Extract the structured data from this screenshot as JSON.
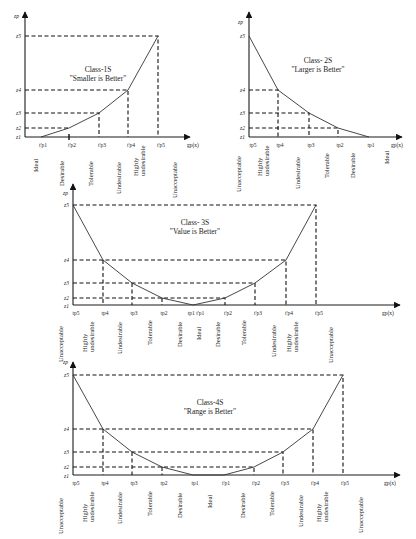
{
  "charts": [
    {
      "id": "class-1s",
      "title_line1": "Class-1S",
      "title_line2": "\"Smaller is Better\"",
      "y_axis_label": "zp",
      "x_axis_label": "gp(x)",
      "z_levels": [
        "z5",
        "z4",
        "z3",
        "z2",
        "z1"
      ],
      "tick_labels": [
        "t'p1",
        "t'p2",
        "t'p3",
        "t'p4",
        "t'p5"
      ],
      "categories": [
        "Ideal",
        "Desirable",
        "Tolerable",
        "Undesirable",
        "Highly undesirable",
        "Unacceptable"
      ]
    },
    {
      "id": "class-2s",
      "title_line1": "Class- 2S",
      "title_line2": "\"Larger is Better\"",
      "y_axis_label": "zp",
      "x_axis_label": "gp(x)",
      "z_levels": [
        "z5",
        "z4",
        "z3",
        "z2",
        "z1"
      ],
      "tick_labels": [
        "tp5",
        "tp4",
        "tp3",
        "tp2",
        "tp1"
      ],
      "categories": [
        "Unacceptable",
        "Highly undesirable",
        "Undesirable",
        "Tolerable",
        "Desirable",
        "Ideal"
      ]
    },
    {
      "id": "class-3s",
      "title_line1": "Class- 3S",
      "title_line2": "\"Value is Better\"",
      "y_axis_label": "zp",
      "x_axis_label": "gp(x)",
      "z_levels": [
        "z5",
        "z4",
        "z3",
        "z2",
        "z1"
      ],
      "tick_labels": [
        "tp5",
        "tp4",
        "tp3",
        "tp2",
        "tp1 t'p1",
        "t'p2",
        "t'p3",
        "t'p4",
        "t'p5"
      ],
      "categories": [
        "Unacceptable",
        "Highly undesirable",
        "Undesirable",
        "Tolerable",
        "Desirable",
        "Ideal",
        "Desirable",
        "Tolerable",
        "Undesirable",
        "Highly undesirable",
        "Unacceptable"
      ]
    },
    {
      "id": "class-4s",
      "title_line1": "Class-4S",
      "title_line2": "\"Range is Better\"",
      "y_axis_label": "zp",
      "x_axis_label": "gp(x)",
      "z_levels": [
        "z5",
        "z4",
        "z3",
        "z2",
        "z1"
      ],
      "tick_labels": [
        "tp5",
        "tp4",
        "tp3",
        "tp2",
        "tp1",
        "t'p1",
        "t'p2",
        "t'p3",
        "t'p4",
        "t'p5"
      ],
      "categories": [
        "Unacceptable",
        "Highly undesirable",
        "Undesirable",
        "Tolerable",
        "Desirable",
        "Ideal",
        "Desirable",
        "Tolerable",
        "Undesirable",
        "Highly undesirable",
        "Unacceptable"
      ]
    }
  ]
}
